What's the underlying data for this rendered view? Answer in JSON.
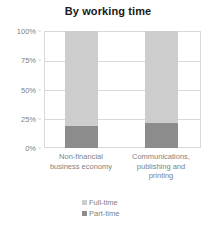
{
  "chart_data": {
    "type": "bar",
    "title": "By working time",
    "subtitle": "",
    "xlabel": "",
    "ylabel": "",
    "stacked": true,
    "grid": true,
    "legend_position": "bottom",
    "ylim": [
      0,
      100
    ],
    "ytick_labels": [
      "100%",
      "75%",
      "50%",
      "25%",
      "0%"
    ],
    "ytick_values": [
      100,
      75,
      50,
      25,
      0
    ],
    "categories": [
      "Non-financial business economy",
      "Communications, publishing and printing"
    ],
    "category_lines": [
      [
        "Non-financial",
        "business economy"
      ],
      [
        "Communications,",
        "publishing and",
        "printing"
      ]
    ],
    "series": [
      {
        "name": "Full-time",
        "values": [
          81,
          79
        ],
        "color": "#cdcdcd"
      },
      {
        "name": "Part-time",
        "values": [
          19,
          21
        ],
        "color": "#8c8c8c"
      }
    ]
  },
  "legend": {
    "items": [
      {
        "label": "Full-time",
        "color": "#cdcdcd"
      },
      {
        "label": "Part-time",
        "color": "#8c8c8c"
      }
    ]
  }
}
